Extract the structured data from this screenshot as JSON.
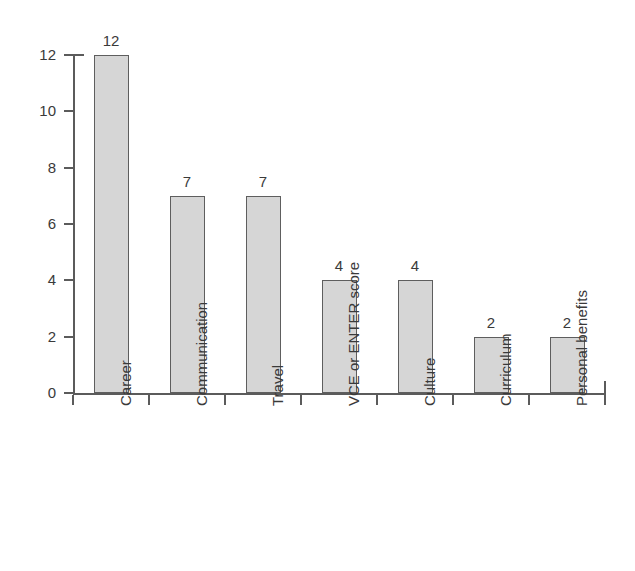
{
  "chart_data": {
    "type": "bar",
    "title": "",
    "subtitle": "",
    "xlabel": "",
    "ylabel": "",
    "categories": [
      "Career",
      "Communication",
      "Travel",
      "VCE or ENTER score",
      "Culture",
      "Curriculum",
      "Personal benefits"
    ],
    "values": [
      12,
      7,
      7,
      4,
      4,
      2,
      2
    ],
    "value_labels": [
      "12",
      "7",
      "7",
      "4",
      "4",
      "2",
      "2"
    ],
    "ylim": [
      0,
      12
    ],
    "y_ticks": [
      0,
      2,
      4,
      6,
      8,
      10,
      12
    ],
    "y_tick_labels": [
      "0",
      "2",
      "4",
      "6",
      "8",
      "10",
      "12"
    ],
    "grid": false,
    "legend": false,
    "legend_position": "none",
    "orientation": "vertical",
    "x_tick_label_rotation": -90,
    "colors": {
      "bar_fill": "#d6d6d6",
      "bar_border": "#5e5e5e",
      "axis": "#5b5b5b",
      "text": "#3a3a3a",
      "background": "#ffffff"
    }
  }
}
